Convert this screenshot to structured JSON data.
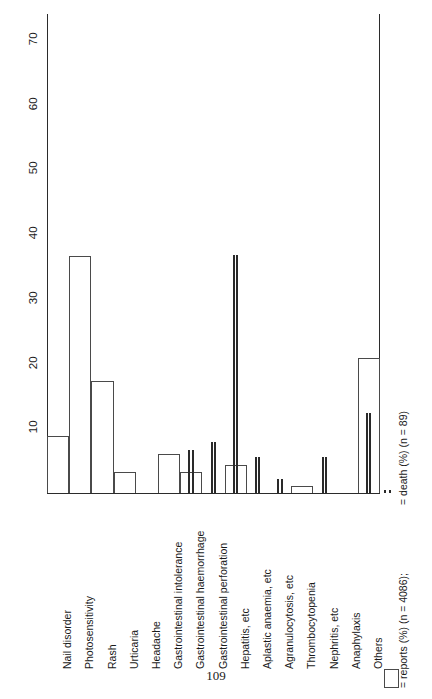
{
  "page": {
    "number": "109"
  },
  "chart_data": {
    "type": "bar",
    "title": "",
    "xlabel": "",
    "ylabel": "",
    "ylim": [
      0,
      74
    ],
    "grid": false,
    "ytick_values": [
      10,
      20,
      30,
      40,
      50,
      60,
      70
    ],
    "ytick_labels": [
      "10",
      "20",
      "30",
      "40",
      "50",
      "60",
      "70"
    ],
    "categories": [
      "Nail disorder",
      "Photosensitivity",
      "Rash",
      "Urticaria",
      "Headache",
      "Gastrointestinal intolerance",
      "Gastrointestinal haemorrhage",
      "Gastrointestinal perforation",
      "Hepatitis, etc",
      "Aplastic anaemia, etc",
      "Agranulocytosis, etc",
      "Thrombocytopenia",
      "Nephritis, etc",
      "Anaphylaxis",
      "Others"
    ],
    "series": [
      {
        "name": "reports (%) (n = 4086)",
        "style": "open-bar",
        "values": [
          8.8,
          36.6,
          17.3,
          3.2,
          0.0,
          6.0,
          3.2,
          0.0,
          4.3,
          0.0,
          0.0,
          1.1,
          0.0,
          0.0,
          20.9
        ]
      },
      {
        "name": "death (%) (n = 89)",
        "style": "thick-line-pair",
        "values": [
          0.0,
          0.0,
          0.0,
          0.0,
          0.0,
          0.0,
          6.7,
          7.9,
          36.8,
          5.6,
          2.2,
          0.0,
          5.6,
          0.0,
          12.4
        ]
      }
    ],
    "legend": {
      "position": "right",
      "entries": [
        {
          "key": "reports-swatch",
          "text": "= reports (%) (n = 4086);"
        },
        {
          "key": "death-swatch",
          "text": "= death (%) (n = 89)"
        }
      ]
    }
  }
}
